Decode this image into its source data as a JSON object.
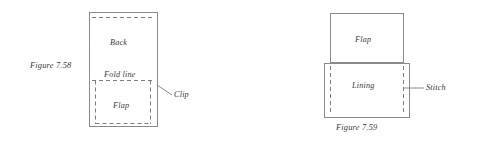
{
  "document": {
    "kind": "technical-sewing-diagram-pair",
    "background_color": "#ffffff",
    "line_color": "#8a8a8a",
    "text_color": "#3a3a3a"
  },
  "figure_758": {
    "caption": "Figure 7.58",
    "labels": {
      "back": "Back",
      "fold_line": "Fold line",
      "flap": "Flap",
      "clip": "Clip"
    },
    "geometry": {
      "outer_rect": {
        "x": 89,
        "y": 12,
        "width": 68,
        "height": 115
      },
      "top_dashed_line_y": 17,
      "fold_dashed_line_y": 80,
      "flap_dashed_rect": {
        "x": 95,
        "y": 80,
        "width": 56,
        "height": 44
      },
      "clip_leader": {
        "x1": 157,
        "y1": 85,
        "x2": 172,
        "y2": 95
      }
    }
  },
  "figure_759": {
    "caption": "Figure 7.59",
    "labels": {
      "flap": "Flap",
      "lining": "Lining",
      "stitch": "Stitch"
    },
    "geometry": {
      "flap_rect": {
        "x": 330,
        "y": 13,
        "width": 74,
        "height": 50
      },
      "lining_rect": {
        "x": 324,
        "y": 63,
        "width": 86,
        "height": 55
      },
      "stitch_dashed_x_left": 330,
      "stitch_dashed_x_right": 404,
      "stitch_dashed_y_top": 66,
      "stitch_dashed_y_bottom": 115,
      "stitch_leader": {
        "x1": 404,
        "y1": 88,
        "x2": 424,
        "y2": 88
      }
    }
  }
}
